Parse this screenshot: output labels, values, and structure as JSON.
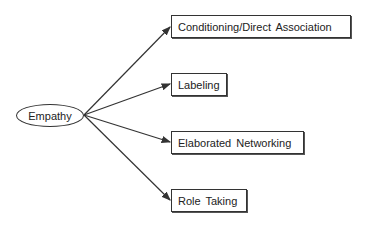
{
  "diagram": {
    "source": {
      "label": "Empathy"
    },
    "targets": [
      {
        "label": "Conditioning/Direct Association"
      },
      {
        "label": "Labeling"
      },
      {
        "label": "Elaborated Networking"
      },
      {
        "label": "Role Taking"
      }
    ],
    "colors": {
      "line": "#333333",
      "background": "#ffffff"
    }
  }
}
